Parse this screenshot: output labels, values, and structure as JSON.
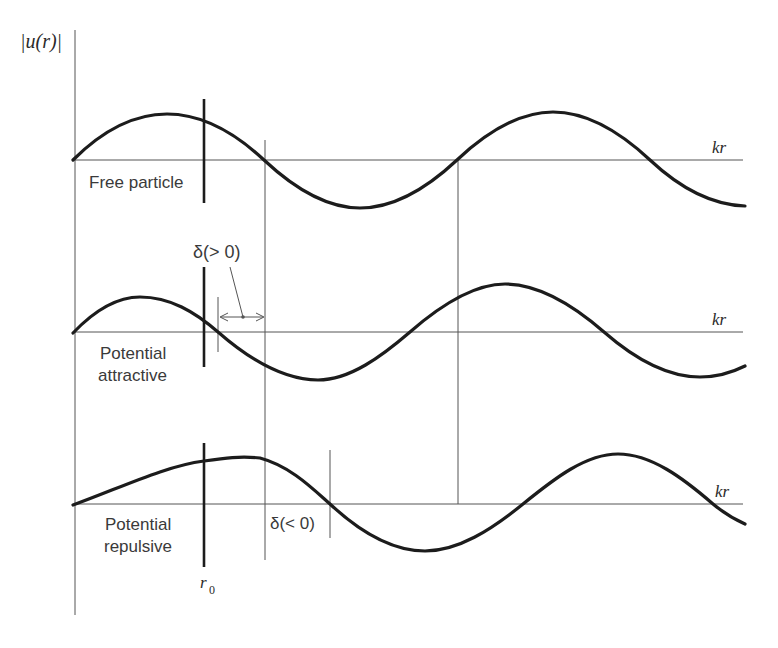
{
  "figure": {
    "y_axis_label": "|u(r)|",
    "x_axis_label": "kr",
    "r0_label": "r",
    "r0_subscript": "0",
    "panels": [
      {
        "id": "free",
        "label_lines": [
          "Free particle"
        ],
        "baseline_y": 160
      },
      {
        "id": "attractive",
        "label_lines": [
          "Potential",
          "attractive"
        ],
        "baseline_y": 332,
        "shift_label": "δ(> 0)"
      },
      {
        "id": "repulsive",
        "label_lines": [
          "Potential",
          "repulsive"
        ],
        "baseline_y": 504,
        "shift_label": "δ(< 0)"
      }
    ],
    "colors": {
      "ink": "#1c1c1c",
      "guide": "#555555",
      "text": "#3a3a3a",
      "background": "#ffffff"
    }
  }
}
